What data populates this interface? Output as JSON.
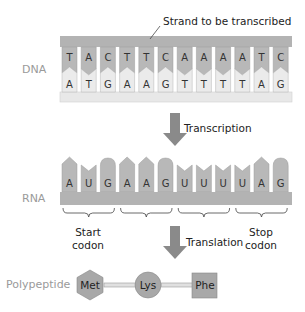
{
  "annotation": {
    "strand_label": "Strand to be transcribed"
  },
  "rows": {
    "dna_label": "DNA",
    "rna_label": "RNA",
    "polypeptide_label": "Polypeptide"
  },
  "dna": {
    "template_strand": [
      "T",
      "A",
      "C",
      "T",
      "T",
      "C",
      "A",
      "A",
      "A",
      "A",
      "T",
      "C"
    ],
    "coding_strand": [
      "A",
      "T",
      "G",
      "A",
      "A",
      "G",
      "T",
      "T",
      "T",
      "T",
      "A",
      "G"
    ]
  },
  "rna": {
    "bases": [
      "A",
      "U",
      "G",
      "A",
      "A",
      "G",
      "U",
      "U",
      "U",
      "U",
      "A",
      "G"
    ],
    "codons": [
      {
        "label_line1": "Start",
        "label_line2": "codon"
      },
      {
        "label_line1": "",
        "label_line2": ""
      },
      {
        "label_line1": "",
        "label_line2": ""
      },
      {
        "label_line1": "Stop",
        "label_line2": "codon"
      }
    ]
  },
  "steps": {
    "transcription": "Transcription",
    "translation": "Translation"
  },
  "polypeptide": {
    "amino_acids": [
      {
        "name": "Met",
        "shape": "hexagon"
      },
      {
        "name": "Lys",
        "shape": "circle"
      },
      {
        "name": "Phe",
        "shape": "square"
      }
    ]
  },
  "colors": {
    "backbone_dark": "#b3b3b3",
    "backbone_light": "#e8e8e8",
    "base_dark": "#b8b8b8",
    "base_light": "#ebebeb",
    "arrow": "#8a8a8a",
    "label_gray": "#9a9a9a"
  }
}
